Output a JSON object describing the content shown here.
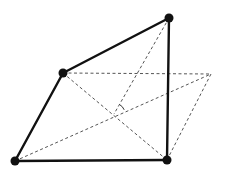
{
  "diagram": {
    "type": "geometric-figure",
    "colors": {
      "stroke": "#111111",
      "dashed": "#555555",
      "background": "#ffffff"
    },
    "vertices": [
      {
        "id": "top-right",
        "x": 169,
        "y": 18
      },
      {
        "id": "left-middle",
        "x": 63,
        "y": 73
      },
      {
        "id": "bottom-left",
        "x": 15,
        "y": 161
      },
      {
        "id": "bottom-right",
        "x": 167,
        "y": 160
      }
    ],
    "aux_point": {
      "id": "parallelogram-corner",
      "x": 211,
      "y": 74
    },
    "intersection": {
      "x": 114,
      "y": 114
    },
    "solid_edges": [
      [
        "top-right",
        "left-middle"
      ],
      [
        "left-middle",
        "bottom-left"
      ],
      [
        "bottom-left",
        "bottom-right"
      ],
      [
        "bottom-right",
        "top-right"
      ]
    ],
    "dashed_edges": [
      [
        "left-middle",
        "parallelogram-corner"
      ],
      [
        "parallelogram-corner",
        "bottom-right"
      ],
      [
        "left-middle",
        "bottom-right"
      ],
      [
        "bottom-left",
        "parallelogram-corner"
      ],
      [
        "top-right",
        "intersection"
      ]
    ],
    "angle_mark": {
      "label": "angle-between-lines"
    }
  }
}
